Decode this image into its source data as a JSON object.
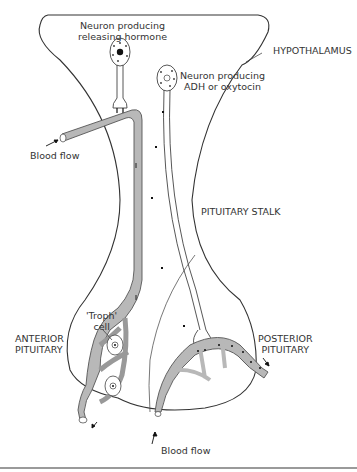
{
  "diagram": {
    "type": "anatomical-diagram",
    "labels": {
      "releasing_neuron_line1": "Neuron producing",
      "releasing_neuron_line2": "releasing hormone",
      "hypothalamus": "HYPOTHALAMUS",
      "adh_neuron_line1": "Neuron producing",
      "adh_neuron_line2": "ADH or oxytocin",
      "blood_flow_top": "Blood flow",
      "pituitary_stalk": "PITUITARY STALK",
      "troph_line1": "'Troph'",
      "troph_line2": "cell",
      "anterior_line1": "ANTERIOR",
      "anterior_line2": "PITUITARY",
      "posterior_line1": "POSTERIOR",
      "posterior_line2": "PITUITARY",
      "blood_flow_bottom": "Blood flow"
    },
    "colors": {
      "outline": "#333333",
      "vessel_fill": "#b8b8b8",
      "vessel_stroke": "#555555",
      "rule": "#9a9a9a"
    }
  }
}
